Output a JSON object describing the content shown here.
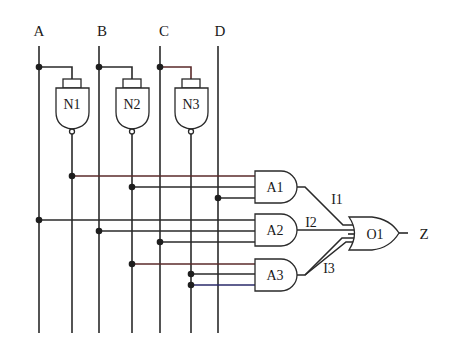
{
  "diagram": {
    "type": "logic-circuit",
    "inputs": [
      {
        "id": "A",
        "label": "A",
        "x": 39
      },
      {
        "id": "B",
        "label": "B",
        "x": 99
      },
      {
        "id": "C",
        "label": "C",
        "x": 160
      },
      {
        "id": "D",
        "label": "D",
        "x": 218
      }
    ],
    "not_gates": [
      {
        "id": "N1",
        "label": "N1",
        "input": "A",
        "out_x": 72
      },
      {
        "id": "N2",
        "label": "N2",
        "input": "B",
        "out_x": 132
      },
      {
        "id": "N3",
        "label": "N3",
        "input": "C",
        "out_x": 191
      }
    ],
    "and_gates": [
      {
        "id": "A1",
        "label": "A1",
        "inputs": [
          "N1",
          "N2",
          "D"
        ]
      },
      {
        "id": "A2",
        "label": "A2",
        "inputs": [
          "A",
          "B",
          "C"
        ]
      },
      {
        "id": "A3",
        "label": "A3",
        "inputs": [
          "N2",
          "N3",
          "N3"
        ]
      }
    ],
    "or_gates": [
      {
        "id": "O1",
        "label": "O1",
        "inputs": [
          "I1",
          "I2",
          "I3"
        ]
      }
    ],
    "intermediate_signals": [
      {
        "label": "I1",
        "from": "A1",
        "to": "O1"
      },
      {
        "label": "I2",
        "from": "A2",
        "to": "O1"
      },
      {
        "label": "I3",
        "from": "A3",
        "to": "O1"
      }
    ],
    "output": {
      "label": "Z",
      "from": "O1"
    }
  }
}
